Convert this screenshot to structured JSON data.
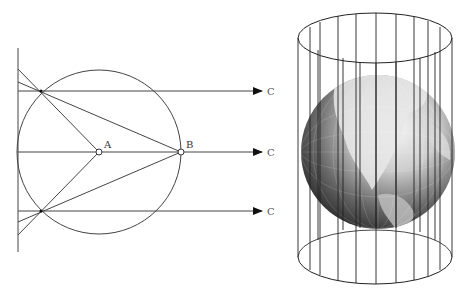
{
  "figure": {
    "left_diagram": {
      "title": "Geometric projection construction",
      "points": {
        "A": {
          "label": "A",
          "x": 99,
          "y": 152
        },
        "B": {
          "label": "B",
          "x": 181,
          "y": 152
        }
      },
      "circle": {
        "cx": 99,
        "cy": 152,
        "r": 82
      },
      "projection_plane_x": 18,
      "arrow_targets": [
        {
          "label": "C",
          "y": 91
        },
        {
          "label": "C",
          "y": 152
        },
        {
          "label": "C",
          "y": 211
        }
      ]
    },
    "right_diagram": {
      "title": "Globe inside a cylinder (cylindrical projection)",
      "cylinder_meridian_lines": 13
    }
  }
}
